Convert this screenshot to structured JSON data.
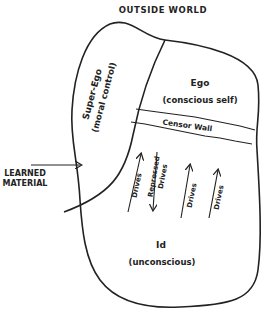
{
  "title": "OUTSIDE WORLD",
  "regions": {
    "super_ego": {
      "name": "Super-Ego",
      "desc": "(moral control)"
    },
    "ego": {
      "name": "Ego",
      "desc": "(conscious self)"
    },
    "censor_wall": {
      "name": "Censor Wall"
    },
    "id": {
      "name": "Id",
      "desc": "(unconscious)"
    }
  },
  "external_input": {
    "line1": "LEARNED",
    "line2": "MATERIAL"
  },
  "arrows": [
    {
      "label": "Drives",
      "direction": "up"
    },
    {
      "label_line1": "Repressed",
      "label_line2": "Drives",
      "direction": "down"
    },
    {
      "label": "Drives",
      "direction": "up"
    },
    {
      "label": "Drives",
      "direction": "up"
    }
  ],
  "colors": {
    "ink": "#222222",
    "background": "#ffffff"
  }
}
